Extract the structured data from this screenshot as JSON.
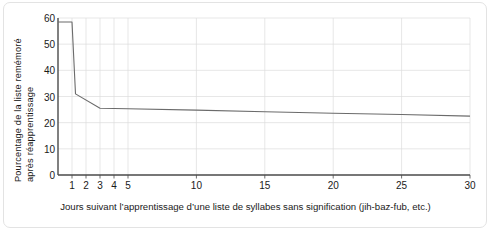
{
  "chart_data": {
    "type": "line",
    "title": "",
    "xlabel": "Jours suivant l’apprentissage d’une liste de syllabes sans signification (jih-baz-fub, etc.)",
    "ylabel_line1": "Pourcentage de la liste remémoré",
    "ylabel_line2": "après réapprentissage",
    "ylim": [
      0,
      60
    ],
    "yticks": [
      0,
      10,
      20,
      30,
      40,
      50,
      60
    ],
    "ytick_labels": [
      "0",
      "10",
      "20",
      "30",
      "40",
      "50",
      "60"
    ],
    "xticks": [
      1,
      2,
      3,
      4,
      5,
      10,
      15,
      20,
      25,
      30
    ],
    "xtick_labels": [
      "1",
      "2",
      "3",
      "4",
      "5",
      "10",
      "15",
      "20",
      "25",
      "30"
    ],
    "xlim": [
      0,
      30
    ],
    "grid": true,
    "grid_color": "#dcdcdc",
    "axis_color": "#4a4a4a",
    "line_color": "#6b6b6b",
    "series": [
      {
        "name": "rétention",
        "x": [
          0,
          1,
          1.25,
          3,
          5,
          10,
          15,
          20,
          25,
          30
        ],
        "values": [
          58.5,
          58.5,
          31.0,
          25.5,
          25.3,
          24.8,
          24.2,
          23.6,
          23.1,
          22.5
        ]
      }
    ],
    "annotations": []
  },
  "frame": {
    "border_color": "#e3e3e3",
    "background": "#ffffff"
  }
}
